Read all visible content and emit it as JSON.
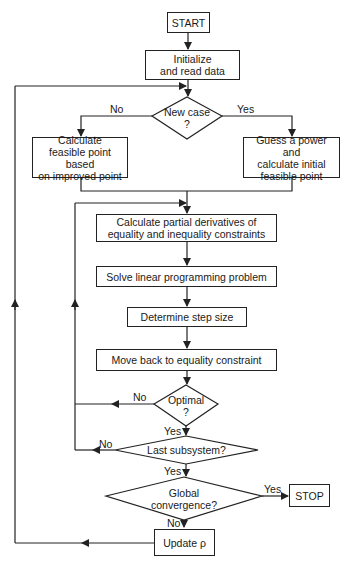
{
  "flowchart": {
    "nodes": {
      "start": "START",
      "initialize": "Initialize\nand read data",
      "new_case": "New case\n?",
      "calc_feasible": "Calculate\nfeasible point based\non improved point",
      "guess_power": "Guess a power and\ncalculate initial\nfeasible point",
      "partial_derivs": "Calculate partial derivatives of\nequality and inequality constraints",
      "solve_lp": "Solve linear programming problem",
      "step_size": "Determine step size",
      "move_back": "Move back to equality constraint",
      "optimal": "Optimal\n?",
      "last_subsystem": "Last subsystem?",
      "global_convergence": "Global\nconvergence?",
      "stop": "STOP",
      "update_rho": "Update ρ"
    },
    "edge_labels": {
      "new_case_no": "No",
      "new_case_yes": "Yes",
      "optimal_no": "No",
      "optimal_yes": "Yes",
      "last_no": "No",
      "last_yes": "Yes",
      "global_yes": "Yes",
      "global_no": "No"
    }
  }
}
